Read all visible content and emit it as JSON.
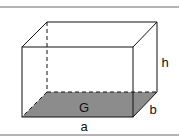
{
  "figure": {
    "labels": {
      "base": "G",
      "length": "a",
      "depth": "b",
      "height": "h"
    },
    "colors": {
      "base_fill": "#8c8c8c",
      "edge": "#111111",
      "frame": "#9a9a9a"
    }
  }
}
